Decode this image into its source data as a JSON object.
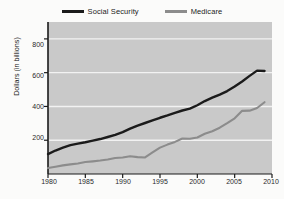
{
  "chart_data": {
    "type": "line",
    "title": "",
    "xlabel": "",
    "ylabel": "Dollars (in billions)",
    "xlim": [
      1980,
      2010
    ],
    "ylim": [
      0,
      900
    ],
    "xticks": [
      1980,
      1985,
      1990,
      1995,
      2000,
      2005,
      2010
    ],
    "yticks": [
      200,
      400,
      600,
      800
    ],
    "grid": "horizontal-white",
    "legend_position": "top-center",
    "plot_background": "#c9c9c9",
    "series": [
      {
        "name": "Social Security",
        "color": "#1b1b1b",
        "x": [
          1980,
          1981,
          1982,
          1983,
          1984,
          1985,
          1986,
          1987,
          1988,
          1989,
          1990,
          1991,
          1992,
          1993,
          1994,
          1995,
          1996,
          1997,
          1998,
          1999,
          2000,
          2001,
          2002,
          2003,
          2004,
          2005,
          2006,
          2007,
          2008,
          2009
        ],
        "values": [
          118,
          139,
          156,
          171,
          180,
          188,
          198,
          207,
          219,
          232,
          248,
          269,
          287,
          302,
          317,
          333,
          347,
          362,
          376,
          387,
          407,
          432,
          452,
          470,
          491,
          518,
          548,
          581,
          612,
          610
        ]
      },
      {
        "name": "Medicare",
        "color": "#8c8c8c",
        "x": [
          1980,
          1981,
          1982,
          1983,
          1984,
          1985,
          1986,
          1987,
          1988,
          1989,
          1990,
          1991,
          1992,
          1993,
          1994,
          1995,
          1996,
          1997,
          1998,
          1999,
          2000,
          2001,
          2002,
          2003,
          2004,
          2005,
          2006,
          2007,
          2008,
          2009
        ],
        "values": [
          35,
          43,
          51,
          57,
          62,
          71,
          75,
          80,
          86,
          95,
          98,
          105,
          100,
          98,
          128,
          156,
          174,
          190,
          210,
          209,
          216,
          238,
          253,
          274,
          301,
          330,
          374,
          375,
          391,
          425
        ]
      }
    ]
  },
  "legend": {
    "entries": [
      {
        "label": "Social Security"
      },
      {
        "label": "Medicare"
      }
    ]
  },
  "axes": {
    "ylabel": "Dollars (in billions)",
    "ytick_labels": [
      "800",
      "600",
      "400",
      "200"
    ],
    "xtick_labels": [
      "1980",
      "1985",
      "1990",
      "1995",
      "2000",
      "2005",
      "2010"
    ]
  }
}
